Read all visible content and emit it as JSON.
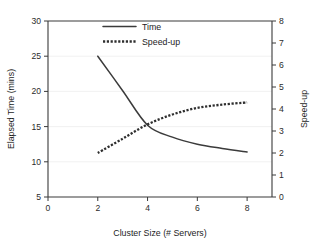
{
  "chart_data": {
    "type": "line",
    "title": "",
    "xlabel": "Cluster Size (# Servers)",
    "ylabel": "Elapsed Time (mins)",
    "y2label": "Speed-up",
    "xlim": [
      0,
      9
    ],
    "ylim": [
      5,
      30
    ],
    "y2lim": [
      0,
      8
    ],
    "xticks": [
      0,
      2,
      4,
      6,
      8
    ],
    "xticklabels": [
      "0",
      "2",
      "4",
      "6",
      "8"
    ],
    "yticks": [
      5,
      10,
      15,
      20,
      25,
      30
    ],
    "yticklabels": [
      "5",
      "10",
      "15",
      "20",
      "25",
      "30"
    ],
    "y2ticks": [
      0,
      1,
      2,
      3,
      4,
      5,
      6,
      7,
      8
    ],
    "y2ticklabels": [
      "0",
      "1",
      "2",
      "3",
      "4",
      "5",
      "6",
      "7",
      "8"
    ],
    "grid": true,
    "legend_position": "top-center",
    "x": [
      2,
      3,
      4,
      5,
      6,
      7,
      8
    ],
    "series": [
      {
        "name": "Time",
        "axis": "left",
        "style": "solid",
        "color": "#3b3b3b",
        "values": [
          25.0,
          20.1,
          15.2,
          13.5,
          12.5,
          11.9,
          11.4
        ]
      },
      {
        "name": "Speed-up",
        "axis": "right",
        "style": "dotted",
        "color": "#2f2f2f",
        "values": [
          2.0,
          2.65,
          3.3,
          3.75,
          4.05,
          4.2,
          4.3
        ]
      }
    ]
  },
  "legend": {
    "entries": [
      {
        "label": "Time",
        "style": "solid"
      },
      {
        "label": "Speed-up",
        "style": "dotted"
      }
    ]
  }
}
